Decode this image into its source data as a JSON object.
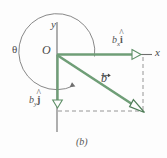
{
  "figure": {
    "caption": "(b)",
    "axis_labels": {
      "y": "y",
      "x": "x",
      "origin": "O"
    },
    "angle_label": "θ",
    "vector_label": "b",
    "components": {
      "x_component_base": "b",
      "x_component_sub": "x",
      "x_component_unit": "i",
      "y_component_base": "b",
      "y_component_sub": "y",
      "y_component_unit": "j"
    },
    "colors": {
      "vector_green": "#6f9e77",
      "vector_green_dark": "#4f7d58",
      "axis_gray": "#6e6e6e",
      "dashed_gray": "#8a8a8a",
      "arc_gray": "#7a7a7a",
      "text_gray": "#444444",
      "background": "#fdfdfd"
    },
    "geometry": {
      "origin_x": 57,
      "origin_y": 54,
      "vector_tip_x": 143,
      "vector_tip_y": 111,
      "x_arrow_tip_x": 141,
      "y_arrow_tip_y": 108,
      "arc_radius": 38
    }
  }
}
